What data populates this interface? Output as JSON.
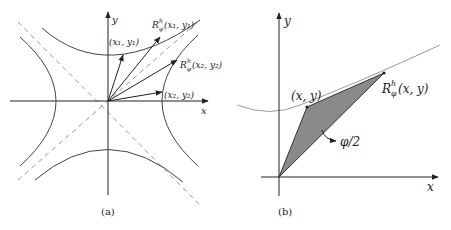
{
  "panel_a": {
    "caption": "(a)",
    "axis_x": "x",
    "axis_y": "y",
    "point1": "(x₁, y₁)",
    "point2": "(x₂, y₂)",
    "rot1_R": "R",
    "rot1_sup": "h",
    "rot1_sub": "φ",
    "rot1_args": "(x₁, y₁)",
    "rot2_R": "R",
    "rot2_sup": "h",
    "rot2_sub": "φ",
    "rot2_args": "(x₂, y₂)"
  },
  "panel_b": {
    "caption": "(b)",
    "axis_x": "x",
    "axis_y": "y",
    "point": "(x, y)",
    "rot_R": "R",
    "rot_sup": "h",
    "rot_sub": "φ",
    "rot_args": "(x, y)",
    "area_label": "φ/2",
    "fill_color": "#8a8a8a"
  }
}
